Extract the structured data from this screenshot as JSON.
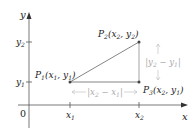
{
  "diagram": {
    "axes": {
      "x_label": "x",
      "y_label": "y",
      "origin_label": "0",
      "x_ticks": [
        "x1",
        "x2"
      ],
      "y_ticks": [
        "y1",
        "y2"
      ]
    },
    "points": [
      {
        "id": "P1",
        "label": "P",
        "sub": "1",
        "coords": "(x1, y1)"
      },
      {
        "id": "P2",
        "label": "P",
        "sub": "2",
        "coords": "(x2, y2)"
      },
      {
        "id": "P3",
        "label": "P",
        "sub": "3",
        "coords": "(x2, y1)"
      }
    ],
    "dimensions": {
      "horizontal": "|x2 − x1|",
      "vertical": "|y2 − y1|"
    },
    "colors": {
      "axis": "#555555",
      "segment": "#777777",
      "vertical_leg": "#999999",
      "point": "#444444",
      "dimension": "#bbbbbb"
    }
  }
}
